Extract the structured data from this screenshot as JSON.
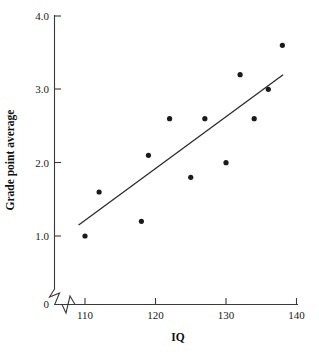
{
  "chart_data": {
    "type": "scatter",
    "title": "",
    "xlabel": "IQ",
    "ylabel": "Grade point average",
    "xlim": [
      108,
      140
    ],
    "ylim": [
      0,
      4.0
    ],
    "grid": false,
    "legend": null,
    "x_ticks": [
      "110",
      "120",
      "130",
      "140"
    ],
    "x_tick_values": [
      110,
      120,
      130,
      140
    ],
    "y_ticks": [
      "0",
      "1.0",
      "2.0",
      "3.0",
      "4.0"
    ],
    "y_tick_values": [
      0,
      1.0,
      2.0,
      3.0,
      4.0
    ],
    "axis_break": "both",
    "origin_label": "0",
    "x": [
      110,
      112,
      118,
      119,
      122,
      125,
      127,
      130,
      132,
      134,
      136,
      138
    ],
    "y": [
      1.0,
      1.6,
      1.2,
      2.1,
      2.6,
      1.8,
      2.6,
      2.0,
      3.2,
      2.6,
      3.0,
      3.6
    ],
    "points": [
      {
        "x": 110,
        "y": 1.0
      },
      {
        "x": 112,
        "y": 1.6
      },
      {
        "x": 118,
        "y": 1.2
      },
      {
        "x": 119,
        "y": 2.1
      },
      {
        "x": 122,
        "y": 2.6
      },
      {
        "x": 125,
        "y": 1.8
      },
      {
        "x": 127,
        "y": 2.6
      },
      {
        "x": 130,
        "y": 2.0
      },
      {
        "x": 132,
        "y": 3.2
      },
      {
        "x": 134,
        "y": 2.6
      },
      {
        "x": 136,
        "y": 3.0
      },
      {
        "x": 138,
        "y": 3.6
      }
    ],
    "trend_line": {
      "type": "linear-fit",
      "x_start": 109.1,
      "y_start": 1.15,
      "x_end": 138.1,
      "y_end": 3.2
    },
    "marker": {
      "shape": "circle",
      "size_px": 2.6,
      "color": "#1b1b1b"
    },
    "colors": {
      "point": "#1b1b1b",
      "line": "#2b2b2b",
      "axis": "#3a3a3a",
      "text": "#1a1a1a",
      "background": "#ffffff"
    }
  }
}
